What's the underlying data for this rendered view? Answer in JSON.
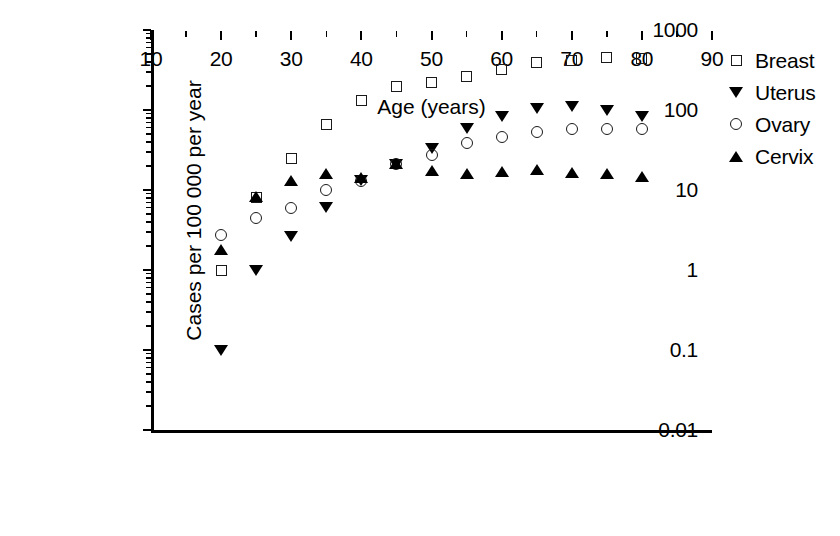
{
  "chart_data": {
    "type": "scatter",
    "title": "",
    "xlabel": "Age (years)",
    "ylabel": "Cases per 100 000 per year",
    "xscale": "linear",
    "yscale": "log",
    "xlim": [
      10,
      90
    ],
    "ylim": [
      0.01,
      1000
    ],
    "grid": false,
    "legend_position": "right",
    "x_ticks": [
      "10",
      "20",
      "30",
      "40",
      "50",
      "60",
      "70",
      "80",
      "90"
    ],
    "x_tick_values": [
      10,
      20,
      30,
      40,
      50,
      60,
      70,
      80,
      90
    ],
    "x_minor_tick_values": [
      15,
      25,
      35,
      45,
      55,
      65,
      75,
      85
    ],
    "y_ticks": [
      "0.01",
      "0.1",
      "1",
      "10",
      "100",
      "1000"
    ],
    "y_tick_values": [
      0.01,
      0.1,
      1,
      10,
      100,
      1000
    ],
    "x": [
      20,
      25,
      30,
      35,
      40,
      45,
      50,
      55,
      60,
      65,
      70,
      75,
      80
    ],
    "series": [
      {
        "name": "Breast",
        "marker": "open-square",
        "color": "#1a1a1a",
        "x": [
          20,
          25,
          30,
          35,
          40,
          45,
          50,
          55,
          60,
          65,
          70,
          75,
          80
        ],
        "values": [
          1.0,
          8.0,
          25.0,
          65.0,
          130.0,
          195.0,
          220.0,
          265.0,
          320.0,
          390.0,
          420.0,
          450.0,
          440.0
        ]
      },
      {
        "name": "Uterus",
        "marker": "filled-triangle-down",
        "color": "#000000",
        "x": [
          20,
          25,
          30,
          35,
          40,
          45,
          50,
          55,
          60,
          65,
          70,
          75,
          80
        ],
        "values": [
          0.1,
          1.0,
          2.6,
          6.0,
          13.0,
          21.0,
          33.0,
          58.0,
          82.0,
          105.0,
          110.0,
          100.0,
          82.0
        ]
      },
      {
        "name": "Ovary",
        "marker": "open-circle",
        "color": "#1a1a1a",
        "x": [
          20,
          25,
          30,
          35,
          40,
          45,
          50,
          55,
          60,
          65,
          70,
          75,
          80
        ],
        "values": [
          2.7,
          4.5,
          6.0,
          10.0,
          13.0,
          21.0,
          27.0,
          39.0,
          46.0,
          53.0,
          58.0,
          58.0,
          58.0
        ]
      },
      {
        "name": "Cervix",
        "marker": "filled-triangle-up",
        "color": "#000000",
        "x": [
          20,
          25,
          30,
          35,
          40,
          45,
          50,
          55,
          60,
          65,
          70,
          75,
          80
        ],
        "values": [
          1.8,
          8.2,
          13.0,
          16.0,
          14.0,
          21.0,
          17.5,
          16.0,
          17.0,
          18.0,
          16.5,
          16.0,
          14.5
        ]
      }
    ]
  },
  "legend": {
    "items": [
      {
        "label": "Breast",
        "marker": "open-square"
      },
      {
        "label": "Uterus",
        "marker": "filled-triangle-down"
      },
      {
        "label": "Ovary",
        "marker": "open-circle"
      },
      {
        "label": "Cervix",
        "marker": "filled-triangle-up"
      }
    ]
  }
}
